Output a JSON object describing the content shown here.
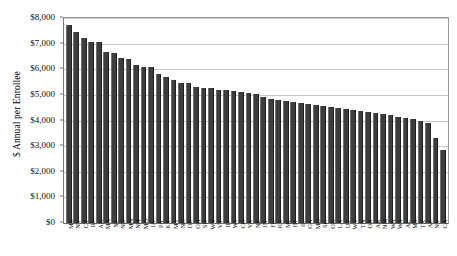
{
  "chart_data": {
    "type": "bar",
    "title": "",
    "xlabel": "",
    "ylabel": "$ Annual per Enrollee",
    "ylim": [
      0,
      8000
    ],
    "ytick_labels": [
      "$8,000",
      "$7,000",
      "$6,000",
      "$5,000",
      "$4,000",
      "$3,000",
      "$2,000",
      "$1,000",
      "$0"
    ],
    "ytick_values": [
      8000,
      7000,
      6000,
      5000,
      4000,
      3000,
      2000,
      1000,
      0
    ],
    "grid": true,
    "legend": "none",
    "orientation": "vertical",
    "sorted": "descending",
    "categories": [
      "ME",
      "NY",
      "CT",
      "RI",
      "AK",
      "MA",
      "NJ",
      "ND",
      "MN",
      "NH",
      "MD",
      "IA",
      "PA",
      "KY",
      "MT",
      "NC",
      "DE",
      "OH",
      "SD",
      "WV",
      "VT",
      "ID",
      "WI",
      "CO",
      "VA",
      "NE",
      "IN",
      "FL",
      "KS",
      "MI",
      "HI",
      "IL",
      "GA",
      "MO",
      "SC",
      "OK",
      "LA",
      "UT",
      "WY",
      "TN",
      "OR",
      "AR",
      "NM",
      "WA",
      "WA",
      "AL",
      "MS",
      "TX",
      "AZ",
      "NV",
      "CA"
    ],
    "values": [
      7720,
      7460,
      7220,
      7070,
      7050,
      6680,
      6620,
      6450,
      6400,
      6150,
      6100,
      6080,
      5800,
      5680,
      5600,
      5480,
      5450,
      5300,
      5270,
      5250,
      5200,
      5180,
      5150,
      5120,
      5080,
      5020,
      4900,
      4840,
      4800,
      4760,
      4720,
      4680,
      4640,
      4600,
      4560,
      4520,
      4480,
      4440,
      4400,
      4360,
      4320,
      4280,
      4240,
      4200,
      4150,
      4100,
      4050,
      4000,
      3920,
      3300,
      2830
    ],
    "series": [
      {
        "name": "Annual spending per enrollee",
        "values": [
          7720,
          7460,
          7220,
          7070,
          7050,
          6680,
          6620,
          6450,
          6400,
          6150,
          6100,
          6080,
          5800,
          5680,
          5600,
          5480,
          5450,
          5300,
          5270,
          5250,
          5200,
          5180,
          5150,
          5120,
          5080,
          5020,
          4900,
          4840,
          4800,
          4760,
          4720,
          4680,
          4640,
          4600,
          4560,
          4520,
          4480,
          4440,
          4400,
          4360,
          4320,
          4280,
          4240,
          4200,
          4150,
          4100,
          4050,
          4000,
          3920,
          3300,
          2830
        ]
      }
    ],
    "colors": {
      "bar": "#3d3d3d",
      "grid": "#c8c8c8",
      "axis": "#6a6a6a",
      "text": "#111111",
      "background": "#ffffff"
    }
  }
}
